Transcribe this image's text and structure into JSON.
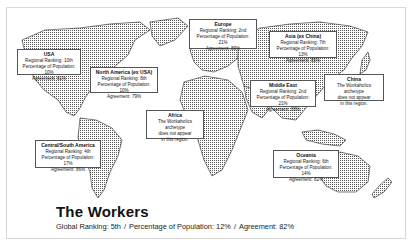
{
  "title": "The Workers",
  "global": {
    "ranking_label": "Global Ranking: 5th",
    "population_label": "Percentage of Population: 12%",
    "agreement_label": "Agreement: 82%",
    "separator": "/"
  },
  "regions": [
    {
      "name": "USA",
      "lines": [
        "Regional Ranking: 10th",
        "Percentage of Population: 10%",
        "Agreement: 81%"
      ]
    },
    {
      "name": "North America (ex USA)",
      "lines": [
        "Regional Ranking: 8th",
        "Percentage of Population: 10%",
        "Agreement: 79%"
      ]
    },
    {
      "name": "Europe",
      "lines": [
        "Regional Ranking: 2nd",
        "Percentage of Population: 21%",
        "Agreement: 89%"
      ]
    },
    {
      "name": "Asia (ex China)",
      "lines": [
        "Regional Ranking: 7th",
        "Percentage of Population: 13%",
        "Agreement: 85%"
      ]
    },
    {
      "name": "China",
      "lines": [
        "The Workaholics archetype",
        "does not appear",
        "in this region."
      ]
    },
    {
      "name": "Middle East",
      "lines": [
        "Regional Ranking: 2nd",
        "Percentage of Population: 21%",
        "Agreement: 88%"
      ]
    },
    {
      "name": "Africa",
      "lines": [
        "The Workaholics archetype",
        "does not appear",
        "in this region."
      ]
    },
    {
      "name": "Central/South America",
      "lines": [
        "Regional Ranking: 4th",
        "Percentage of Population: 17%",
        "Agreement: 86%"
      ]
    },
    {
      "name": "Oceania",
      "lines": [
        "Regional Ranking: 6th",
        "Percentage of Population: 14%",
        "Agreement: 82%"
      ]
    }
  ]
}
